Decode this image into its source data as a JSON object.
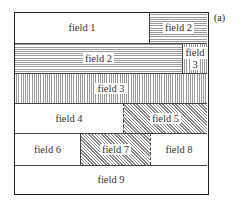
{
  "diagram": {
    "label": "(a)",
    "fields": [
      {
        "id": "field-1",
        "text": "field 1",
        "pattern": "none"
      },
      {
        "id": "field-2-top",
        "text": "field 2",
        "pattern": "horizontal-lines"
      },
      {
        "id": "field-2",
        "text": "field 2",
        "pattern": "horizontal-lines"
      },
      {
        "id": "field-3-small",
        "text": "field 3",
        "pattern": "vertical-lines"
      },
      {
        "id": "field-3",
        "text": "field 3",
        "pattern": "vertical-lines"
      },
      {
        "id": "field-4",
        "text": "field 4",
        "pattern": "none"
      },
      {
        "id": "field-5",
        "text": "field 5",
        "pattern": "diagonal-lines"
      },
      {
        "id": "field-6",
        "text": "field 6",
        "pattern": "none"
      },
      {
        "id": "field-7",
        "text": "field 7",
        "pattern": "diagonal-lines"
      },
      {
        "id": "field-8",
        "text": "field 8",
        "pattern": "none"
      },
      {
        "id": "field-9",
        "text": "field 9",
        "pattern": "none"
      }
    ],
    "field3_small_lines": [
      "field",
      "3"
    ]
  }
}
